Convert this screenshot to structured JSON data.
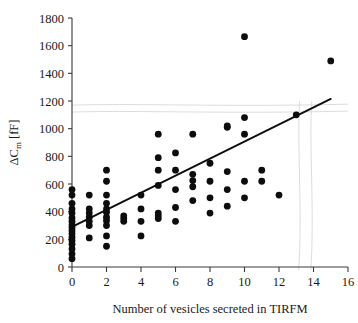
{
  "chart_data": {
    "type": "scatter",
    "title": "",
    "xlabel": "Number of vesicles secreted in TIRFM",
    "ylabel": "ΔC",
    "ylabel_sub": "m",
    "ylabel_unit": " [fF]",
    "ylabel_full": "ΔC_m [fF]",
    "xlim": [
      0,
      16
    ],
    "ylim": [
      0,
      1800
    ],
    "xticks": [
      0,
      2,
      4,
      6,
      8,
      10,
      12,
      14,
      16
    ],
    "xtick_labels": [
      "0",
      "2",
      "4",
      "6",
      "8",
      "10",
      "12",
      "14",
      "16"
    ],
    "yticks": [
      0,
      200,
      400,
      600,
      800,
      1000,
      1200,
      1400,
      1600,
      1800
    ],
    "ytick_labels": [
      "0",
      "200",
      "400",
      "600",
      "800",
      "1000",
      "1200",
      "1400",
      "1600",
      "1800"
    ],
    "grid": false,
    "legend": "none",
    "marker_color": "#0d0d0d",
    "marker_size": 3.4,
    "line_color": "#0d0d0d",
    "series": [
      {
        "name": "vesicle secretion vs capacitance change",
        "points": [
          [
            0,
            60
          ],
          [
            0,
            95
          ],
          [
            0,
            130
          ],
          [
            0,
            165
          ],
          [
            0,
            190
          ],
          [
            0,
            215
          ],
          [
            0,
            240
          ],
          [
            0,
            262
          ],
          [
            0,
            285
          ],
          [
            0,
            305
          ],
          [
            0,
            330
          ],
          [
            0,
            355
          ],
          [
            0,
            390
          ],
          [
            0,
            420
          ],
          [
            0,
            460
          ],
          [
            0,
            520
          ],
          [
            0,
            560
          ],
          [
            1,
            210
          ],
          [
            1,
            300
          ],
          [
            1,
            330
          ],
          [
            1,
            360
          ],
          [
            1,
            390
          ],
          [
            1,
            420
          ],
          [
            1,
            520
          ],
          [
            2,
            150
          ],
          [
            2,
            225
          ],
          [
            2,
            300
          ],
          [
            2,
            335
          ],
          [
            2,
            360
          ],
          [
            2,
            395
          ],
          [
            2,
            420
          ],
          [
            2,
            460
          ],
          [
            2,
            520
          ],
          [
            2,
            620
          ],
          [
            2,
            700
          ],
          [
            3,
            330
          ],
          [
            3,
            350
          ],
          [
            3,
            370
          ],
          [
            4,
            225
          ],
          [
            4,
            330
          ],
          [
            4,
            420
          ],
          [
            4,
            520
          ],
          [
            5,
            350
          ],
          [
            5,
            370
          ],
          [
            5,
            390
          ],
          [
            5,
            590
          ],
          [
            5,
            700
          ],
          [
            5,
            790
          ],
          [
            5,
            960
          ],
          [
            6,
            330
          ],
          [
            6,
            430
          ],
          [
            6,
            560
          ],
          [
            6,
            700
          ],
          [
            6,
            825
          ],
          [
            7,
            480
          ],
          [
            7,
            580
          ],
          [
            7,
            625
          ],
          [
            7,
            670
          ],
          [
            7,
            960
          ],
          [
            8,
            390
          ],
          [
            8,
            500
          ],
          [
            8,
            620
          ],
          [
            8,
            750
          ],
          [
            9,
            440
          ],
          [
            9,
            560
          ],
          [
            9,
            690
          ],
          [
            9,
            1010
          ],
          [
            9,
            1020
          ],
          [
            10,
            500
          ],
          [
            10,
            620
          ],
          [
            10,
            960
          ],
          [
            10,
            1080
          ],
          [
            10,
            1665
          ],
          [
            11,
            620
          ],
          [
            11,
            700
          ],
          [
            12,
            520
          ],
          [
            13,
            1100
          ],
          [
            15,
            1490
          ]
        ]
      }
    ],
    "fit_line": {
      "name": "linear regression",
      "x0": 0,
      "y0": 290,
      "x1": 15,
      "y1": 1215
    },
    "scan_artifacts": [
      {
        "name": "horizontal-upper",
        "y": 1170
      },
      {
        "name": "horizontal-lower",
        "y": 1120
      },
      {
        "name": "vertical-left",
        "x": 13.2
      },
      {
        "name": "vertical-right",
        "x": 13.9
      }
    ]
  }
}
